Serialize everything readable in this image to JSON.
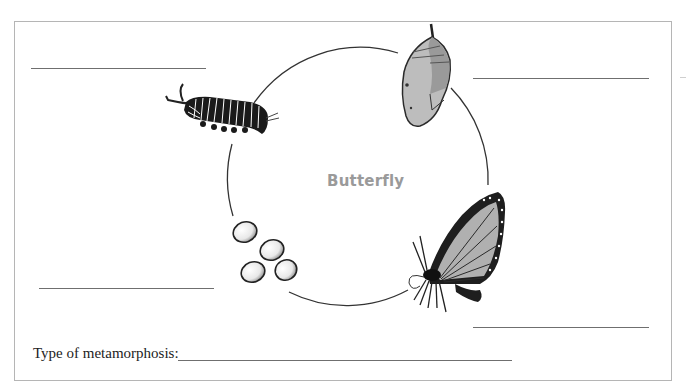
{
  "worksheet": {
    "title": "Butterfly",
    "metamorphosis_prompt": "Type of metamorphosis:",
    "stages": [
      {
        "name": "caterpillar",
        "position": "top-left",
        "answer_blank": ""
      },
      {
        "name": "chrysalis",
        "position": "top-right",
        "answer_blank": ""
      },
      {
        "name": "adult-butterfly",
        "position": "bottom-right",
        "answer_blank": ""
      },
      {
        "name": "eggs",
        "position": "bottom-left",
        "answer_blank": ""
      }
    ],
    "metamorphosis_answer": ""
  },
  "colors": {
    "border": "#b5b5b5",
    "line": "#6f6f6f",
    "title": "#9a9a9a",
    "cycle": "#333333"
  }
}
